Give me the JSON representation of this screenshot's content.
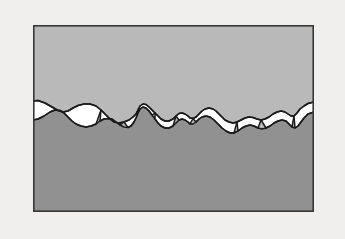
{
  "figure": {
    "canvas": {
      "width": 345,
      "height": 239
    },
    "background_color": "#f0efee",
    "frame": {
      "name": "image-frame",
      "x": 33,
      "y": 25,
      "width": 281,
      "height": 187,
      "border_color": "#383838",
      "border_width": 1.6
    },
    "regions": [
      {
        "id": "upper-phase",
        "label": "Upper phase",
        "fill_color": "#b9b9b9",
        "position": "top"
      },
      {
        "id": "lower-phase",
        "label": "Lower phase",
        "fill_color": "#919191",
        "position": "bottom"
      },
      {
        "id": "voids",
        "label": "Interfacial voids",
        "fill_color": "#ffffff",
        "outline_color": "#1a1a1a",
        "outline_width": 1.5,
        "count": 11,
        "position": "interface"
      }
    ],
    "geometry": {
      "upper_boundary_path": "M 33,101 L 38,100.5 L 45,103 L 52,107 L 58,110.5 L 63,112 L 68,111 L 73,108 L 78,105.5 L 84,104 L 90,104 L 96,106 L 101,110 L 106,115 L 110,119 L 114,122 L 119,123 L 124,122 L 129,120 L 133,117 L 136,114 L 138,110 L 140,106 L 143,104 L 146,104.5 L 149,107 L 152,110 L 155,113 L 158,116 L 161,119 L 165,121 L 169,121 L 173,119 L 176,116 L 179,113.5 L 182,113 L 185,114 L 188,116 L 190,118 L 193,118.5 L 196,117 L 199,114 L 202,111 L 205,109 L 209,108 L 213,109 L 216,111 L 219,114 L 222,117 L 225,120 L 229,122 L 233,123 L 237,122 L 241,120 L 245,118 L 249,117 L 253,117.5 L 257,119 L 261,120 L 265,119 L 269,117 L 273,114 L 277,112 L 281,111 L 285,112 L 288,114 L 291,116 L 294,116 L 297,113 L 300,109 L 304,106 L 308,103.5 L 314,102",
      "lower_boundary_path": "M 33,120 L 38,119 L 44,116 L 50,112 L 55,110 L 60,110.5 L 64,113 L 68,117 L 72,121 L 76,124 L 81,126 L 86,127 L 91,126 L 96,124 L 100,121 L 104,119 L 108,118.5 L 112,119 L 116,122 L 120,125 L 124,127 L 128,127.5 L 131,126 L 134,122 L 136,118 L 138,113 L 140,109 L 143,107 L 146,108 L 149,111 L 152,115 L 155,119 L 158,123 L 161,126 L 165,128 L 169,128 L 173,126 L 176,123 L 179,120 L 182,119 L 185,120 L 188,122 L 190,124 L 193,124 L 196,122 L 199,119 L 202,117 L 206,116 L 210,117 L 214,120 L 218,124 L 222,128 L 226,131 L 230,133 L 234,133 L 238,131 L 242,128 L 246,126 L 250,125 L 254,126 L 258,128 L 262,129 L 266,128 L 270,126 L 274,123 L 278,121 L 282,120 L 286,121 L 289,124 L 292,127 L 295,128 L 298,126 L 301,122 L 304,118 L 308,114 L 314,112"
    },
    "void_shapes": [
      {
        "id": "void-1",
        "path": "M 33,101 L 38,100.5 L 45,103 L 52,107 L 58,110.5 L 63,112 L 60,110.5 L 55,110 L 50,112 L 44,116 L 38,119 L 33,120 Z"
      },
      {
        "id": "void-2",
        "path": "M 63,112 L 68,111 L 73,108 L 78,105.5 L 84,104 L 90,104 L 96,106 L 101,110 L 96,124 L 91,126 L 86,127 L 81,126 L 76,124 L 72,121 L 68,117 L 64,113 Z"
      },
      {
        "id": "void-3",
        "path": "M 101,110 L 106,115 L 110,119 L 114,122 L 119,123 L 124,122 L 120,125 L 116,122 L 112,119 L 108,118.5 L 104,119 L 100,121 Z"
      },
      {
        "id": "void-4",
        "path": "M 124,122 L 129,120 L 133,117 L 136,114 L 138,110 L 140,106 L 143,104 L 146,104.5 L 149,107 L 152,110 L 155,113 L 152,115 L 149,111 L 146,108 L 143,107 L 140,109 L 138,113 L 136,118 L 134,122 L 131,126 L 128,127.5 Z"
      },
      {
        "id": "void-5",
        "path": "M 155,113 L 158,116 L 161,119 L 165,121 L 169,121 L 173,119 L 176,116 L 173,126 L 169,128 L 165,128 L 161,126 L 158,123 L 155,119 Z"
      },
      {
        "id": "void-6",
        "path": "M 176,116 L 179,113.5 L 182,113 L 185,114 L 188,116 L 190,118 L 193,118.5 L 190,124 L 188,122 L 185,120 L 182,119 L 179,120 Z"
      },
      {
        "id": "void-7",
        "path": "M 193,118.5 L 196,117 L 199,114 L 202,111 L 205,109 L 209,108 L 213,109 L 216,111 L 219,114 L 222,117 L 225,120 L 229,122 L 233,123 L 237,122 L 234,133 L 230,133 L 226,131 L 222,128 L 218,124 L 214,120 L 210,117 L 206,116 L 202,117 L 199,119 L 196,122 Z"
      },
      {
        "id": "void-8",
        "path": "M 237,122 L 241,120 L 245,118 L 249,117 L 253,117.5 L 257,119 L 261,120 L 258,128 L 254,126 L 250,125 L 246,126 L 242,128 L 238,131 Z"
      },
      {
        "id": "void-9",
        "path": "M 261,120 L 265,119 L 269,117 L 273,114 L 277,112 L 281,111 L 285,112 L 288,114 L 291,116 L 294,116 L 292,127 L 289,124 L 286,121 L 282,120 L 278,121 L 274,123 L 270,126 L 266,128 Z"
      },
      {
        "id": "void-10",
        "path": "M 294,116 L 297,113 L 300,109 L 304,106 L 308,103.5 L 314,102 L 314,112 L 308,114 L 304,118 L 301,122 L 298,126 L 295,128 Z"
      }
    ]
  }
}
